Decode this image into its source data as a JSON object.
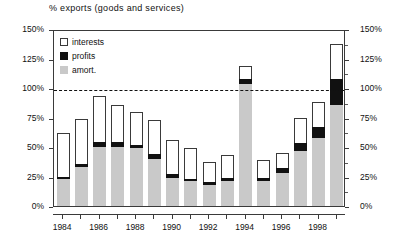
{
  "chart_data": {
    "type": "bar",
    "title": "% exports (goods and services)",
    "subtitle": "",
    "xlabel": "",
    "ylabel": "",
    "ylim": [
      0,
      150
    ],
    "ytick_labels": [
      "0%",
      "25%",
      "50%",
      "75%",
      "100%",
      "125%",
      "150%"
    ],
    "ytick_values": [
      0,
      25,
      50,
      75,
      100,
      125,
      150
    ],
    "right_axis_labels": [
      "0%",
      "25%",
      "50%",
      "75%",
      "100%",
      "125%",
      "150%"
    ],
    "grid": false,
    "legend_position": "top-left",
    "stacked": true,
    "reference_line": {
      "value": 100,
      "style": "dashed",
      "label": ""
    },
    "categories": [
      "1984",
      "1985",
      "1986",
      "1987",
      "1988",
      "1989",
      "1990",
      "1991",
      "1992",
      "1993",
      "1994",
      "1995",
      "1996",
      "1997",
      "1998",
      "1999"
    ],
    "xtick_labels": [
      "1984",
      "1986",
      "1988",
      "1990",
      "1992",
      "1994",
      "1996",
      "1998"
    ],
    "series": [
      {
        "name": "amort.",
        "color": "#c9c9c9",
        "values": [
          23,
          33,
          50,
          50,
          49,
          40,
          24,
          21,
          18,
          21,
          103,
          21,
          28,
          47,
          58,
          86
        ]
      },
      {
        "name": "profits",
        "color": "#111111",
        "values": [
          2,
          3,
          4,
          4,
          3,
          4,
          3,
          2,
          2,
          3,
          5,
          3,
          4,
          6,
          9,
          22
        ]
      },
      {
        "name": "interests",
        "color": "#ffffff",
        "values": [
          37,
          38,
          39,
          32,
          28,
          29,
          29,
          26,
          17,
          19,
          11,
          15,
          13,
          22,
          21,
          29
        ]
      }
    ],
    "totals": [
      62,
      74,
      93,
      86,
      80,
      73,
      56,
      49,
      37,
      43,
      119,
      39,
      45,
      75,
      88,
      137
    ]
  },
  "legend": {
    "items": [
      {
        "label": "interests",
        "swatch": "white-square"
      },
      {
        "label": "profits",
        "swatch": "black-square"
      },
      {
        "label": "amort.",
        "swatch": "gray-square"
      }
    ]
  }
}
